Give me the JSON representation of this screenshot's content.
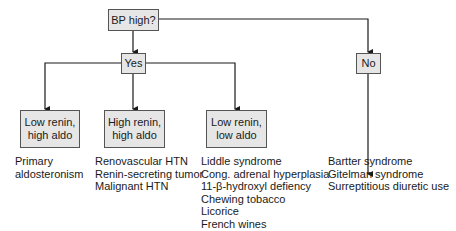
{
  "nodes": {
    "root": {
      "label": "BP high?"
    },
    "yes": {
      "label": "Yes"
    },
    "no": {
      "label": "No"
    },
    "low_renin_high_aldo": {
      "line1": "Low renin,",
      "line2": "high aldo"
    },
    "high_renin_high_aldo": {
      "line1": "High renin,",
      "line2": "high aldo"
    },
    "low_renin_low_aldo": {
      "line1": "Low renin,",
      "line2": "low aldo"
    }
  },
  "outcomes": {
    "low_renin_high_aldo": [
      "Primary",
      "aldosteronism"
    ],
    "high_renin_high_aldo": [
      "Renovascular HTN",
      "Renin-secreting tumor",
      "Malignant HTN"
    ],
    "low_renin_low_aldo": [
      "Liddle syndrome",
      "Cong. adrenal hyperplasia",
      "11-β-hydroxyl defiency",
      "Chewing tobacco",
      "Licorice",
      "French wines"
    ],
    "no": [
      "Bartter syndrome",
      "Gitelman syndrome",
      "Surreptitious diuretic use"
    ]
  },
  "colors": {
    "box_fill": "#e6e6e6",
    "line": "#1a1a1a"
  }
}
